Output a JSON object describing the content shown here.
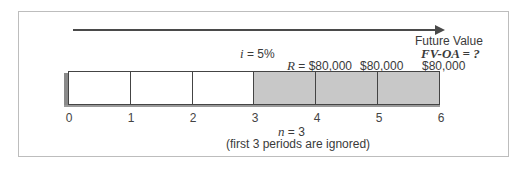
{
  "diagram": {
    "type": "future-value-deferred-annuity-timeline",
    "arrow_direction": "right",
    "future_value_label": "Future Value",
    "future_value_formula": "FV-OA = ?",
    "interest_rate_label": "i = 5%",
    "payments": [
      "R = $80,000",
      "$80,000",
      "$80,000"
    ],
    "periods": [
      "0",
      "1",
      "2",
      "3",
      "4",
      "5",
      "6"
    ],
    "cells": [
      {
        "index": 1,
        "shaded": false
      },
      {
        "index": 2,
        "shaded": false
      },
      {
        "index": 3,
        "shaded": false
      },
      {
        "index": 4,
        "shaded": true
      },
      {
        "index": 5,
        "shaded": true
      },
      {
        "index": 6,
        "shaded": true
      }
    ],
    "n_label": "n = 3",
    "note": "(first 3 periods are ignored)",
    "colors": {
      "shaded_cell": "#c8c8c8",
      "line": "#444444",
      "frame_border": "#bdbdbd"
    }
  }
}
